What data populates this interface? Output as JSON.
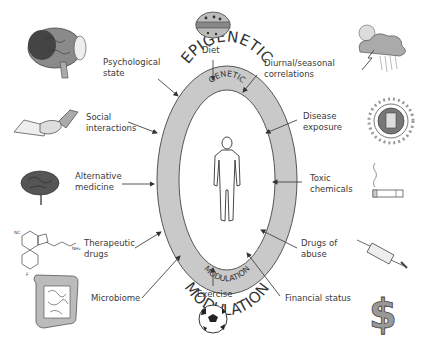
{
  "diagram": {
    "outer_ring": {
      "top_label": "EPIGENETIC",
      "bottom_label": "MODULATION"
    },
    "inner_oval": {
      "top_label": "GENETIC",
      "bottom_label": "MODULATION"
    },
    "center_figure": "human-figure",
    "factors": [
      {
        "label": "Psychological\nstate",
        "icon": "brain-icon"
      },
      {
        "label": "Diet",
        "icon": "food-icon"
      },
      {
        "label": "Diurnal/seasonal\ncorrelations",
        "icon": "weather-icon"
      },
      {
        "label": "Social\ninteractions",
        "icon": "handshake-icon"
      },
      {
        "label": "Disease\nexposure",
        "icon": "virus-icon"
      },
      {
        "label": "Alternative\nmedicine",
        "icon": "herb-icon"
      },
      {
        "label": "Toxic\nchemicals",
        "icon": "cigarette-icon"
      },
      {
        "label": "Therapeutic\ndrugs",
        "icon": "molecule-icon"
      },
      {
        "label": "Drugs of\nabuse",
        "icon": "syringe-icon"
      },
      {
        "label": "Microbiome",
        "icon": "intestine-icon"
      },
      {
        "label": "Exercise",
        "icon": "soccer-ball-icon"
      },
      {
        "label": "Financial status",
        "icon": "dollar-icon"
      }
    ]
  },
  "colors": {
    "ring": "#c8c8c8",
    "ring_stroke": "#555555",
    "inner": "#ffffff",
    "arrow": "#444444",
    "text": "#3a3a3a"
  }
}
